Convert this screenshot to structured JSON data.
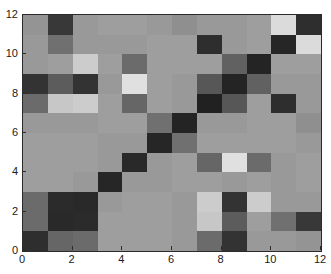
{
  "chart_data": {
    "type": "heatmap",
    "title": "",
    "xlabel": "",
    "ylabel": "",
    "xlim": [
      0,
      12
    ],
    "ylim": [
      0,
      12
    ],
    "xticks": [
      0,
      2,
      4,
      6,
      8,
      10,
      12
    ],
    "yticks": [
      0,
      2,
      4,
      6,
      8,
      10,
      12
    ],
    "xtick_labels": [
      "0",
      "2",
      "4",
      "6",
      "8",
      "10",
      "12"
    ],
    "ytick_labels": [
      "0",
      "2",
      "4",
      "6",
      "8",
      "10",
      "12"
    ],
    "grid": false,
    "legend": "none",
    "colormap": "gray",
    "value_range": [
      0,
      1
    ],
    "rows": 12,
    "cols": 12,
    "row_order": "bottom-to-top",
    "axes_color": "#2b2b2b",
    "background_color": "#ffffff",
    "note": "Symmetric 12x12 grayscale similarity/distance matrix with dark diagonal band",
    "values": [
      [
        0.18,
        0.4,
        0.42,
        0.62,
        0.62,
        0.62,
        0.6,
        0.42,
        0.2,
        0.6,
        0.6,
        0.58
      ],
      [
        0.42,
        0.16,
        0.17,
        0.62,
        0.62,
        0.62,
        0.6,
        0.78,
        0.36,
        0.62,
        0.44,
        0.22
      ],
      [
        0.42,
        0.17,
        0.16,
        0.6,
        0.62,
        0.62,
        0.6,
        0.8,
        0.2,
        0.8,
        0.6,
        0.6
      ],
      [
        0.62,
        0.62,
        0.6,
        0.15,
        0.6,
        0.6,
        0.62,
        0.62,
        0.6,
        0.62,
        0.6,
        0.62
      ],
      [
        0.62,
        0.62,
        0.62,
        0.6,
        0.16,
        0.6,
        0.62,
        0.4,
        0.88,
        0.42,
        0.6,
        0.62
      ],
      [
        0.62,
        0.62,
        0.62,
        0.6,
        0.6,
        0.15,
        0.44,
        0.62,
        0.62,
        0.62,
        0.62,
        0.6
      ],
      [
        0.6,
        0.6,
        0.6,
        0.62,
        0.62,
        0.44,
        0.14,
        0.6,
        0.6,
        0.62,
        0.62,
        0.56
      ],
      [
        0.42,
        0.78,
        0.8,
        0.62,
        0.4,
        0.62,
        0.6,
        0.13,
        0.34,
        0.62,
        0.18,
        0.6
      ],
      [
        0.2,
        0.36,
        0.2,
        0.6,
        0.88,
        0.62,
        0.6,
        0.34,
        0.14,
        0.38,
        0.6,
        0.6
      ],
      [
        0.6,
        0.62,
        0.8,
        0.62,
        0.42,
        0.62,
        0.62,
        0.62,
        0.38,
        0.14,
        0.62,
        0.62
      ],
      [
        0.6,
        0.44,
        0.6,
        0.6,
        0.6,
        0.62,
        0.62,
        0.18,
        0.6,
        0.62,
        0.15,
        0.86
      ],
      [
        0.58,
        0.22,
        0.6,
        0.62,
        0.62,
        0.6,
        0.56,
        0.6,
        0.6,
        0.62,
        0.86,
        0.18
      ]
    ]
  }
}
